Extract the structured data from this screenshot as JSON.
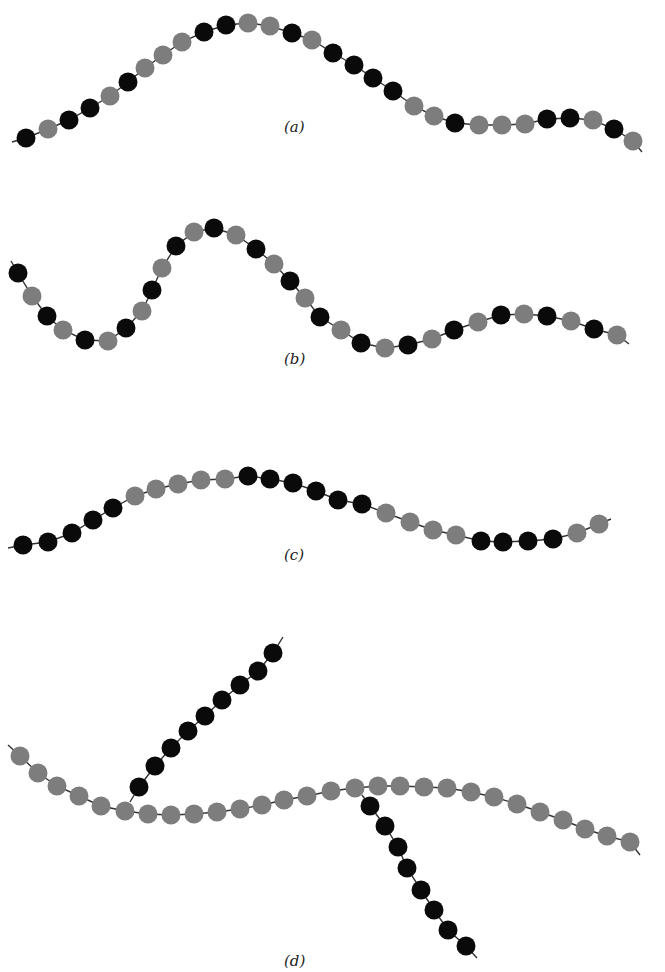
{
  "colors": {
    "black": "#0a0a0a",
    "grey": "#7d7d7d",
    "strand": "#333333",
    "background": "#ffffff"
  },
  "bead_radius": 9.5,
  "panels": [
    {
      "id": "a",
      "label": "(a)",
      "label_pos": [
        296,
        130
      ],
      "chains": [
        {
          "name": "chain-a",
          "tail_start": [
            12,
            142
          ],
          "tail_end": [
            642,
            152
          ],
          "beads": [
            [
              26,
              138,
              "B"
            ],
            [
              48,
              129,
              "G"
            ],
            [
              69,
              120,
              "B"
            ],
            [
              90,
              108,
              "B"
            ],
            [
              110,
              96,
              "G"
            ],
            [
              128,
              82,
              "B"
            ],
            [
              145,
              68,
              "G"
            ],
            [
              163,
              55,
              "G"
            ],
            [
              182,
              42,
              "G"
            ],
            [
              204,
              32,
              "B"
            ],
            [
              226,
              25,
              "B"
            ],
            [
              248,
              23,
              "G"
            ],
            [
              270,
              26,
              "G"
            ],
            [
              292,
              33,
              "B"
            ],
            [
              312,
              40,
              "G"
            ],
            [
              333,
              53,
              "B"
            ],
            [
              354,
              65,
              "B"
            ],
            [
              373,
              78,
              "B"
            ],
            [
              393,
              91,
              "B"
            ],
            [
              414,
              106,
              "G"
            ],
            [
              434,
              116,
              "G"
            ],
            [
              455,
              123,
              "B"
            ],
            [
              479,
              125,
              "G"
            ],
            [
              502,
              125,
              "G"
            ],
            [
              525,
              124,
              "G"
            ],
            [
              547,
              119,
              "B"
            ],
            [
              570,
              118,
              "B"
            ],
            [
              593,
              120,
              "G"
            ],
            [
              614,
              129,
              "B"
            ],
            [
              633,
              141,
              "G"
            ]
          ]
        }
      ]
    },
    {
      "id": "b",
      "label": "(b)",
      "label_pos": [
        296,
        362
      ],
      "chains": [
        {
          "name": "chain-b",
          "tail_start": [
            11,
            261
          ],
          "tail_end": [
            629,
            344
          ],
          "beads": [
            [
              18,
              273,
              "B"
            ],
            [
              32,
              296,
              "G"
            ],
            [
              47,
              316,
              "B"
            ],
            [
              63,
              330,
              "G"
            ],
            [
              85,
              340,
              "B"
            ],
            [
              108,
              341,
              "G"
            ],
            [
              126,
              328,
              "B"
            ],
            [
              142,
              311,
              "G"
            ],
            [
              152,
              290,
              "B"
            ],
            [
              162,
              268,
              "G"
            ],
            [
              176,
              246,
              "B"
            ],
            [
              194,
              232,
              "G"
            ],
            [
              214,
              228,
              "B"
            ],
            [
              236,
              235,
              "G"
            ],
            [
              256,
              249,
              "B"
            ],
            [
              274,
              264,
              "G"
            ],
            [
              290,
              281,
              "B"
            ],
            [
              305,
              298,
              "G"
            ],
            [
              320,
              317,
              "B"
            ],
            [
              341,
              330,
              "G"
            ],
            [
              361,
              343,
              "B"
            ],
            [
              385,
              348,
              "G"
            ],
            [
              408,
              345,
              "B"
            ],
            [
              432,
              339,
              "G"
            ],
            [
              454,
              330,
              "B"
            ],
            [
              478,
              322,
              "G"
            ],
            [
              501,
              315,
              "B"
            ],
            [
              524,
              314,
              "G"
            ],
            [
              547,
              316,
              "B"
            ],
            [
              571,
              321,
              "G"
            ],
            [
              594,
              329,
              "B"
            ],
            [
              617,
              335,
              "G"
            ]
          ]
        }
      ]
    },
    {
      "id": "c",
      "label": "(c)",
      "label_pos": [
        296,
        558
      ],
      "chains": [
        {
          "name": "chain-c",
          "tail_start": [
            8,
            548
          ],
          "tail_end": [
            611,
            519
          ],
          "beads": [
            [
              23,
              545,
              "B"
            ],
            [
              48,
              542,
              "B"
            ],
            [
              72,
              533,
              "B"
            ],
            [
              93,
              520,
              "B"
            ],
            [
              113,
              508,
              "B"
            ],
            [
              135,
              496,
              "G"
            ],
            [
              156,
              489,
              "G"
            ],
            [
              178,
              484,
              "G"
            ],
            [
              201,
              480,
              "G"
            ],
            [
              225,
              479,
              "G"
            ],
            [
              248,
              476,
              "B"
            ],
            [
              270,
              479,
              "B"
            ],
            [
              293,
              483,
              "B"
            ],
            [
              316,
              491,
              "B"
            ],
            [
              338,
              500,
              "B"
            ],
            [
              362,
              504,
              "B"
            ],
            [
              386,
              513,
              "G"
            ],
            [
              410,
              522,
              "G"
            ],
            [
              433,
              530,
              "G"
            ],
            [
              456,
              535,
              "G"
            ],
            [
              481,
              541,
              "B"
            ],
            [
              503,
              542,
              "B"
            ],
            [
              528,
              541,
              "B"
            ],
            [
              553,
              539,
              "B"
            ],
            [
              577,
              533,
              "G"
            ],
            [
              599,
              524,
              "G"
            ]
          ]
        }
      ]
    },
    {
      "id": "d",
      "label": "(d)",
      "label_pos": [
        296,
        964
      ],
      "chains": [
        {
          "name": "chain-d-main",
          "tail_start": [
            8,
            745
          ],
          "tail_end": [
            640,
            855
          ],
          "beads": [
            [
              20,
              756,
              "G"
            ],
            [
              38,
              773,
              "G"
            ],
            [
              57,
              786,
              "G"
            ],
            [
              79,
              796,
              "G"
            ],
            [
              101,
              806,
              "G"
            ],
            [
              125,
              811,
              "G"
            ],
            [
              148,
              814,
              "G"
            ],
            [
              171,
              815,
              "G"
            ],
            [
              194,
              814,
              "G"
            ],
            [
              217,
              812,
              "G"
            ],
            [
              240,
              809,
              "G"
            ],
            [
              262,
              805,
              "G"
            ],
            [
              284,
              800,
              "G"
            ],
            [
              307,
              796,
              "G"
            ],
            [
              331,
              791,
              "G"
            ],
            [
              355,
              788,
              "G"
            ],
            [
              378,
              786,
              "G"
            ],
            [
              400,
              786,
              "G"
            ],
            [
              424,
              787,
              "G"
            ],
            [
              447,
              788,
              "G"
            ],
            [
              471,
              792,
              "G"
            ],
            [
              494,
              797,
              "G"
            ],
            [
              517,
              804,
              "G"
            ],
            [
              540,
              812,
              "G"
            ],
            [
              563,
              820,
              "G"
            ],
            [
              585,
              829,
              "G"
            ],
            [
              607,
              836,
              "G"
            ],
            [
              630,
              842,
              "G"
            ]
          ]
        },
        {
          "name": "chain-d-branch-up",
          "tail_start": [
            130,
            802
          ],
          "tail_end": [
            283,
            637
          ],
          "beads": [
            [
              139,
              787,
              "B"
            ],
            [
              155,
              766,
              "B"
            ],
            [
              171,
              748,
              "B"
            ],
            [
              188,
              731,
              "B"
            ],
            [
              205,
              716,
              "B"
            ],
            [
              222,
              700,
              "B"
            ],
            [
              240,
              685,
              "B"
            ],
            [
              258,
              671,
              "B"
            ],
            [
              273,
              653,
              "B"
            ]
          ]
        },
        {
          "name": "chain-d-branch-down",
          "tail_start": [
            362,
            795
          ],
          "tail_end": [
            477,
            958
          ],
          "beads": [
            [
              370,
              806,
              "B"
            ],
            [
              385,
              826,
              "B"
            ],
            [
              398,
              847,
              "B"
            ],
            [
              407,
              868,
              "B"
            ],
            [
              421,
              890,
              "B"
            ],
            [
              434,
              910,
              "B"
            ],
            [
              448,
              930,
              "B"
            ],
            [
              466,
              946,
              "B"
            ]
          ]
        }
      ]
    }
  ]
}
